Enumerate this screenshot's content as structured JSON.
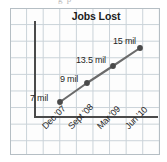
{
  "artifact": {
    "top_text": "g p"
  },
  "chart_data": {
    "type": "line",
    "title": "Jobs Lost",
    "xlabel": "",
    "ylabel": "",
    "grid": true,
    "legend": "none",
    "categories": [
      "Dec '07",
      "Sept '08",
      "Mar '09",
      "Jun '10"
    ],
    "values": [
      7,
      9,
      13.5,
      15
    ],
    "value_labels": [
      "7 mil",
      "9 mil",
      "13.5 mil",
      "15 mil"
    ],
    "units": "mil",
    "series": [
      {
        "name": "Jobs Lost",
        "values": [
          7,
          9,
          13.5,
          15
        ],
        "color": "#6b6b6b"
      }
    ],
    "points": [
      {
        "x": 60,
        "y": 102,
        "label": "7 mil",
        "label_x": 30,
        "label_y": 93
      },
      {
        "x": 87,
        "y": 83,
        "label": "9 mil",
        "label_x": 60,
        "label_y": 74
      },
      {
        "x": 113,
        "y": 66,
        "label": "13.5 mil",
        "label_x": 76,
        "label_y": 55
      },
      {
        "x": 140,
        "y": 48,
        "label": "15 mil",
        "label_x": 113,
        "label_y": 36
      }
    ],
    "tick_positions": [
      {
        "label": "Dec '07",
        "x": 40,
        "y": 124
      },
      {
        "label": "Sept '08",
        "x": 66,
        "y": 124
      },
      {
        "label": "Mar '09",
        "x": 95,
        "y": 124
      },
      {
        "label": "Jun '10",
        "x": 123,
        "y": 124
      }
    ],
    "colors": {
      "line": "#6b6b6b",
      "marker": "#4a4a4a",
      "axis": "#4a4a4a",
      "grid": "#c9d2d8",
      "panel": "#fdfdfd",
      "text": "#1f1f1f"
    }
  }
}
